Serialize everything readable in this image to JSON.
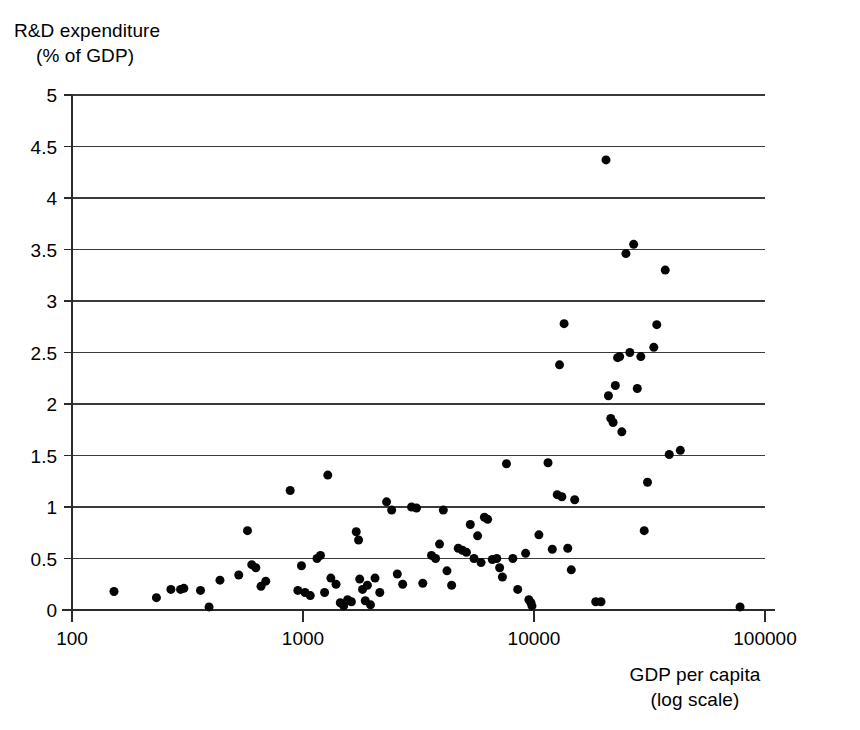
{
  "chart_data": {
    "type": "scatter",
    "title": "",
    "xlabel": "GDP per capita (log scale)",
    "xlabel_line1": "GDP per capita",
    "xlabel_line2": "(log scale)",
    "ylabel": "R&D expenditure (% of GDP)",
    "ylabel_line1": "R&D expenditure",
    "ylabel_line2": "(% of GDP)",
    "x_scale": "log",
    "y_scale": "linear",
    "xlim": [
      100,
      100000
    ],
    "ylim": [
      0,
      5
    ],
    "grid": "horizontal",
    "legend": "none",
    "marker": {
      "shape": "circle",
      "color": "#050505",
      "size_px": 9
    },
    "x_ticks": [
      100,
      1000,
      10000,
      100000
    ],
    "x_tick_labels": [
      "100",
      "1000",
      "10000",
      "100000"
    ],
    "y_ticks": [
      0,
      0.5,
      1,
      1.5,
      2,
      2.5,
      3,
      3.5,
      4,
      4.5,
      5
    ],
    "y_tick_labels": [
      "0",
      "0.5",
      "1",
      "1.5",
      "2",
      "2.5",
      "3",
      "3.5",
      "4",
      "4.5",
      "5"
    ],
    "point_count": 99,
    "points": [
      [
        152,
        0.18
      ],
      [
        232,
        0.12
      ],
      [
        268,
        0.2
      ],
      [
        295,
        0.2
      ],
      [
        305,
        0.21
      ],
      [
        360,
        0.19
      ],
      [
        392,
        0.03
      ],
      [
        437,
        0.29
      ],
      [
        527,
        0.34
      ],
      [
        575,
        0.77
      ],
      [
        600,
        0.44
      ],
      [
        625,
        0.41
      ],
      [
        658,
        0.23
      ],
      [
        690,
        0.28
      ],
      [
        880,
        1.16
      ],
      [
        950,
        0.19
      ],
      [
        985,
        0.43
      ],
      [
        1020,
        0.17
      ],
      [
        1075,
        0.14
      ],
      [
        1150,
        0.5
      ],
      [
        1190,
        0.53
      ],
      [
        1240,
        0.17
      ],
      [
        1280,
        1.31
      ],
      [
        1320,
        0.31
      ],
      [
        1390,
        0.25
      ],
      [
        1450,
        0.07
      ],
      [
        1500,
        0.04
      ],
      [
        1560,
        0.1
      ],
      [
        1620,
        0.08
      ],
      [
        1700,
        0.76
      ],
      [
        1740,
        0.68
      ],
      [
        1760,
        0.3
      ],
      [
        1810,
        0.2
      ],
      [
        1860,
        0.09
      ],
      [
        1900,
        0.24
      ],
      [
        1960,
        0.05
      ],
      [
        2050,
        0.31
      ],
      [
        2150,
        0.17
      ],
      [
        2300,
        1.05
      ],
      [
        2420,
        0.97
      ],
      [
        2560,
        0.35
      ],
      [
        2700,
        0.25
      ],
      [
        2950,
        1.0
      ],
      [
        3100,
        0.99
      ],
      [
        3300,
        0.26
      ],
      [
        3600,
        0.53
      ],
      [
        3750,
        0.5
      ],
      [
        3900,
        0.64
      ],
      [
        4050,
        0.97
      ],
      [
        4200,
        0.38
      ],
      [
        4400,
        0.24
      ],
      [
        4700,
        0.6
      ],
      [
        4900,
        0.58
      ],
      [
        5100,
        0.56
      ],
      [
        5300,
        0.83
      ],
      [
        5500,
        0.5
      ],
      [
        5700,
        0.72
      ],
      [
        5900,
        0.46
      ],
      [
        6100,
        0.9
      ],
      [
        6300,
        0.88
      ],
      [
        6600,
        0.49
      ],
      [
        6900,
        0.5
      ],
      [
        7100,
        0.41
      ],
      [
        7300,
        0.32
      ],
      [
        7600,
        1.42
      ],
      [
        8100,
        0.5
      ],
      [
        8500,
        0.2
      ],
      [
        9200,
        0.55
      ],
      [
        9500,
        0.1
      ],
      [
        9700,
        0.07
      ],
      [
        9800,
        0.04
      ],
      [
        10500,
        0.73
      ],
      [
        11500,
        1.43
      ],
      [
        12000,
        0.59
      ],
      [
        12600,
        1.12
      ],
      [
        12900,
        2.38
      ],
      [
        13200,
        1.1
      ],
      [
        13500,
        2.78
      ],
      [
        14000,
        0.6
      ],
      [
        14500,
        0.39
      ],
      [
        15000,
        1.07
      ],
      [
        18500,
        0.08
      ],
      [
        19500,
        0.08
      ],
      [
        20500,
        4.37
      ],
      [
        21000,
        2.08
      ],
      [
        21500,
        1.86
      ],
      [
        22000,
        1.82
      ],
      [
        22500,
        2.18
      ],
      [
        23000,
        2.45
      ],
      [
        23500,
        2.46
      ],
      [
        24000,
        1.73
      ],
      [
        25000,
        3.46
      ],
      [
        26000,
        2.5
      ],
      [
        27000,
        3.55
      ],
      [
        28000,
        2.15
      ],
      [
        29000,
        2.46
      ],
      [
        30000,
        0.77
      ],
      [
        31000,
        1.24
      ],
      [
        33000,
        2.55
      ],
      [
        34000,
        2.77
      ],
      [
        37000,
        3.3
      ],
      [
        38500,
        1.51
      ],
      [
        43000,
        1.55
      ],
      [
        78000,
        0.03
      ]
    ]
  },
  "axes": {
    "plot_left_px": 72,
    "plot_right_px": 765,
    "plot_top_px": 95,
    "plot_bottom_px": 610,
    "x_axis_end_px": 775
  }
}
